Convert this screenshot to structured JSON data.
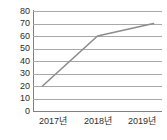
{
  "chart_data": {
    "type": "line",
    "title": "",
    "xlabel": "",
    "ylabel": "",
    "categories": [
      "2017년",
      "2018년",
      "2019년"
    ],
    "values": [
      20,
      60,
      70
    ],
    "series": [
      {
        "name": "",
        "values": [
          20,
          60,
          70
        ]
      }
    ],
    "ylim": [
      0,
      80
    ],
    "ytick_step": 10,
    "yticks": [
      80,
      70,
      60,
      50,
      40,
      30,
      20,
      10,
      0
    ],
    "ytick_labels": [
      "80",
      "70",
      "60",
      "50",
      "40",
      "30",
      "20",
      "10",
      "0"
    ],
    "grid": true,
    "grid_axis": "y",
    "legend": false,
    "legend_position": "none",
    "markers": false,
    "colors": {
      "line": "#8c8c8c",
      "grid": "#a8a8a8",
      "axis": "#808080",
      "text": "#2b2b2b",
      "background": "#ffffff"
    }
  }
}
